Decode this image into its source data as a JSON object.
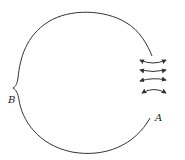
{
  "diagram": {
    "labels": {
      "a": "A",
      "b": "B"
    },
    "colors": {
      "line": "#333333",
      "background": "#ffffff"
    },
    "arrows": {
      "count": 4,
      "type": "double-headed",
      "rows": [
        {
          "y": 60,
          "curvature": "concave-up"
        },
        {
          "y": 70,
          "curvature": "slight-concave-up"
        },
        {
          "y": 80,
          "curvature": "slight-concave-down"
        },
        {
          "y": 91,
          "curvature": "concave-down"
        }
      ]
    }
  }
}
